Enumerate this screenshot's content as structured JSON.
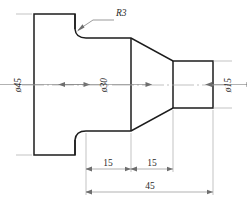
{
  "drawing": {
    "title": "Stepped shaft with flange and conical taper",
    "type": "mechanical-part-orthographic-view",
    "units": "mm",
    "colors": {
      "outline": "#1c1c1c",
      "dimension": "#7d7d7d",
      "extension": "#9a9a9a",
      "centerline": "#a8a8a8",
      "text": "#2a2a2a",
      "background": "#ffffff"
    },
    "dimensions": {
      "diameter_flange": {
        "label": "ø45",
        "value": 45,
        "symbol": "ø",
        "orientation": "vertical",
        "position": "left"
      },
      "diameter_shaft": {
        "label": "ø30",
        "value": 30,
        "symbol": "ø",
        "orientation": "vertical",
        "position": "center"
      },
      "diameter_pin": {
        "label": "ø15",
        "value": 15,
        "symbol": "ø",
        "orientation": "vertical",
        "position": "right"
      },
      "length_shaft": {
        "label": "15",
        "value": 15,
        "orientation": "horizontal",
        "position": "bottom-left"
      },
      "length_taper": {
        "label": "15",
        "value": 15,
        "orientation": "horizontal",
        "position": "bottom-center"
      },
      "length_total": {
        "label": "45",
        "value": 45,
        "orientation": "horizontal",
        "position": "bottom"
      },
      "fillet_radius": {
        "label": "R3",
        "value": 3,
        "symbol": "R",
        "orientation": "leader",
        "position": "top"
      }
    }
  }
}
